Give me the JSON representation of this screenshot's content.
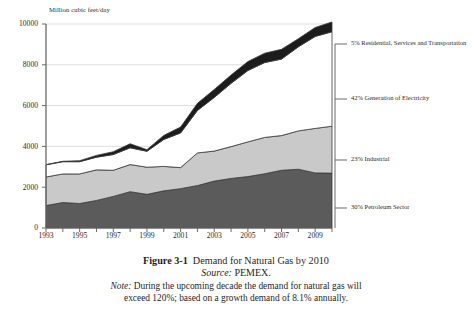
{
  "figure": {
    "number_label": "Figure 3-1",
    "title": "Demand for Natural Gas by 2010",
    "source_label": "Source:",
    "source_value": "PEMEX.",
    "note_label": "Note:",
    "note_line1": "During the upcoming decade the demand for natural gas will",
    "note_line2": "exceed 120%; based on a growth demand of 8.1% annually."
  },
  "colors": {
    "petroleum": "#5b5b5b",
    "industrial": "#c9c9c9",
    "electricity": "#ffffff",
    "residential": "#1c1c1c",
    "axis": "#6a6a6a",
    "gridline": "#d9d9d9",
    "outline": "#3a3a3a",
    "text": "#2b2b2b"
  },
  "legend": {
    "items": [
      {
        "name": "residential",
        "label": "5% Residential, Services and Transportation",
        "percent": 5,
        "swatch": "#1c1c1c"
      },
      {
        "name": "electricity",
        "label": "42% Generation of Electricity",
        "percent": 42,
        "swatch": "#ffffff"
      },
      {
        "name": "industrial",
        "label": "23% Industrial",
        "percent": 23,
        "swatch": "#c9c9c9"
      },
      {
        "name": "petroleum",
        "label": "30% Petroleum Sector",
        "percent": 30,
        "swatch": "#5b5b5b"
      }
    ]
  },
  "chart_data": {
    "type": "area",
    "stacked": true,
    "title": "Demand for Natural Gas by 2010",
    "subtitle": "",
    "xlabel": "",
    "ylabel": "Million cubic feet/day",
    "axis_title": "Million cubic feet/day",
    "xlim": [
      1993,
      2010
    ],
    "ylim": [
      0,
      10000
    ],
    "ytick_step": 2000,
    "yticks": [
      0,
      2000,
      4000,
      6000,
      8000,
      10000
    ],
    "ytick_labels": [
      "0",
      "2000",
      "4000",
      "6000",
      "8000",
      "10000"
    ],
    "xticks": [
      1993,
      1994,
      1995,
      1996,
      1997,
      1998,
      1999,
      2000,
      2001,
      2002,
      2003,
      2004,
      2005,
      2006,
      2007,
      2008,
      2009,
      2010
    ],
    "xtick_labels_shown": [
      "1993",
      "1995",
      "1997",
      "1999",
      "2001",
      "2003",
      "2005",
      "2007",
      "2009"
    ],
    "grid": true,
    "grid_axis": "y",
    "legend_position": "right",
    "x": [
      1993,
      1994,
      1995,
      1996,
      1997,
      1998,
      1999,
      2000,
      2001,
      2002,
      2003,
      2004,
      2005,
      2006,
      2007,
      2008,
      2009,
      2010
    ],
    "series": [
      {
        "name": "30% Petroleum Sector",
        "color": "#5b5b5b",
        "values": [
          1100,
          1250,
          1200,
          1350,
          1550,
          1780,
          1650,
          1820,
          1930,
          2080,
          2300,
          2430,
          2520,
          2660,
          2830,
          2880,
          2700,
          2690
        ]
      },
      {
        "name": "23% Industrial",
        "color": "#c9c9c9",
        "values": [
          1400,
          1400,
          1450,
          1500,
          1280,
          1330,
          1330,
          1200,
          1030,
          1600,
          1470,
          1560,
          1700,
          1780,
          1700,
          1880,
          2180,
          2300
        ]
      },
      {
        "name": "42% Generation of Electricity",
        "color": "#ffffff",
        "values": [
          600,
          600,
          600,
          620,
          770,
          820,
          780,
          1320,
          1700,
          2080,
          2630,
          3100,
          3500,
          3670,
          3750,
          4120,
          4510,
          4630
        ]
      },
      {
        "name": "5% Residential, Services and Transportation",
        "color": "#1c1c1c",
        "values": [
          0,
          20,
          50,
          90,
          140,
          200,
          80,
          200,
          290,
          350,
          390,
          410,
          440,
          460,
          480,
          400,
          440,
          480
        ]
      }
    ],
    "stack_totals": [
      3100,
      3270,
      3300,
      3560,
      3740,
      4130,
      3840,
      4540,
      4950,
      6110,
      6790,
      7500,
      8160,
      8570,
      8760,
      9280,
      9830,
      10100
    ]
  }
}
